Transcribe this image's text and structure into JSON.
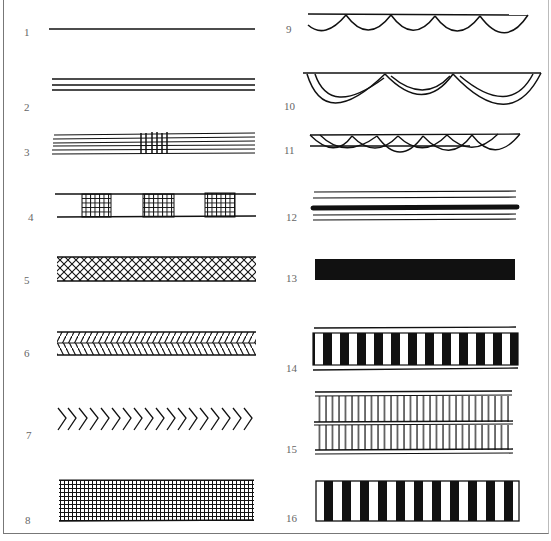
{
  "figure": {
    "patterns": [
      {
        "number": "1",
        "description": "single thin line"
      },
      {
        "number": "2",
        "description": "three parallel lines"
      },
      {
        "number": "3",
        "description": "six parallel lines with vertical crossbars in center"
      },
      {
        "number": "4",
        "description": "double line with three cross-hatched blocks"
      },
      {
        "number": "5",
        "description": "diamond lattice band"
      },
      {
        "number": "6",
        "description": "double herringbone band"
      },
      {
        "number": "7",
        "description": "chevrons"
      },
      {
        "number": "8",
        "description": "dense grid band"
      },
      {
        "number": "9",
        "description": "line with scallops"
      },
      {
        "number": "10",
        "description": "line with double-outlined large scallops"
      },
      {
        "number": "11",
        "description": "line with overlapping scallops"
      },
      {
        "number": "12",
        "description": "four thin lines with thick center line"
      },
      {
        "number": "13",
        "description": "solid black band"
      },
      {
        "number": "14",
        "description": "black and white bars between lines"
      },
      {
        "number": "15",
        "description": "two rows of vertical ticks between three lines"
      },
      {
        "number": "16",
        "description": "black and white vertical bars"
      }
    ]
  }
}
